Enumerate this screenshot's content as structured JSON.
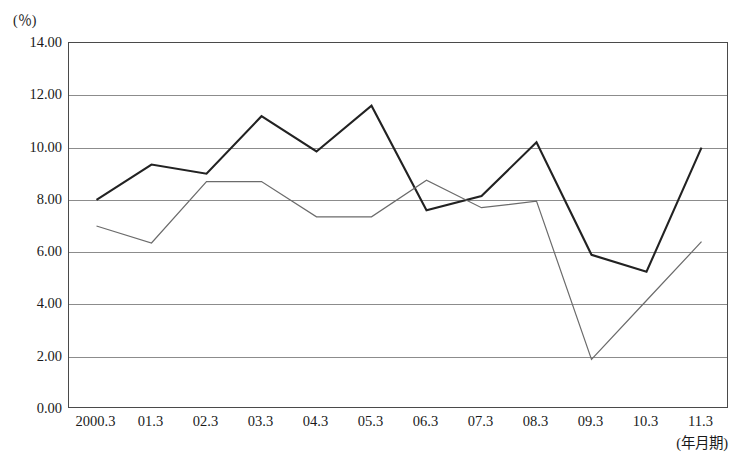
{
  "chart_data": {
    "type": "line",
    "title": "",
    "xlabel": "(年月期)",
    "ylabel": "(％)",
    "categories": [
      "2000.3",
      "01.3",
      "02.3",
      "03.3",
      "04.3",
      "05.3",
      "06.3",
      "07.3",
      "08.3",
      "09.3",
      "10.3",
      "11.3"
    ],
    "ylim": [
      0.0,
      14.0
    ],
    "ytick_step": 2.0,
    "ytick_labels": [
      "0.00",
      "2.00",
      "4.00",
      "6.00",
      "8.00",
      "10.00",
      "12.00",
      "14.00"
    ],
    "ytick_values": [
      0.0,
      2.0,
      4.0,
      6.0,
      8.0,
      10.0,
      12.0,
      14.0
    ],
    "grid": true,
    "legend_position": "none",
    "series": [
      {
        "name": "series-dark",
        "color": "#222222",
        "width": 2.1,
        "values": [
          8.0,
          9.35,
          9.0,
          11.2,
          9.85,
          11.6,
          7.6,
          8.15,
          10.2,
          5.9,
          5.25,
          10.0
        ]
      },
      {
        "name": "series-gray",
        "color": "#6b6b6b",
        "width": 1.2,
        "values": [
          7.0,
          6.35,
          8.7,
          8.7,
          7.35,
          7.35,
          8.75,
          7.7,
          7.95,
          1.9,
          4.15,
          6.4
        ]
      }
    ]
  },
  "axes": {
    "y_unit": "(％)",
    "x_axis_caption": "(年月期)"
  },
  "header": {
    "title_partial": ""
  }
}
